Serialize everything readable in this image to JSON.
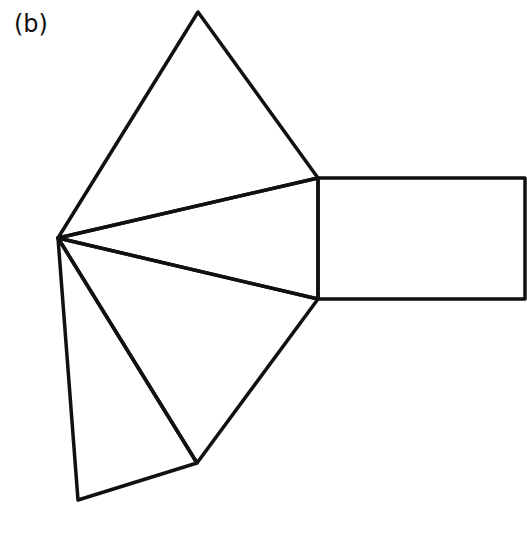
{
  "figure": {
    "label": "(b)",
    "stroke_color": "#111111",
    "background": "#ffffff",
    "vertices": {
      "apex_top": [
        198,
        12
      ],
      "hub_left": [
        58,
        238
      ],
      "rect_top_left": [
        318,
        178
      ],
      "rect_bottom_left": [
        318,
        299
      ],
      "rect_top_right": [
        525,
        178
      ],
      "rect_bottom_right": [
        525,
        299
      ],
      "lower_right": [
        197,
        463
      ],
      "bottom_left": [
        78,
        500
      ]
    },
    "shapes": [
      {
        "name": "top-triangle",
        "points": "58,238 198,12 318,178"
      },
      {
        "name": "middle-triangle",
        "points": "58,238 318,178 318,299"
      },
      {
        "name": "lower-triangle",
        "points": "58,238 318,299 197,463"
      },
      {
        "name": "bottom-triangle",
        "points": "58,238 197,463 78,500"
      },
      {
        "name": "rectangle",
        "points": "318,178 525,178 525,299 318,299"
      }
    ]
  }
}
